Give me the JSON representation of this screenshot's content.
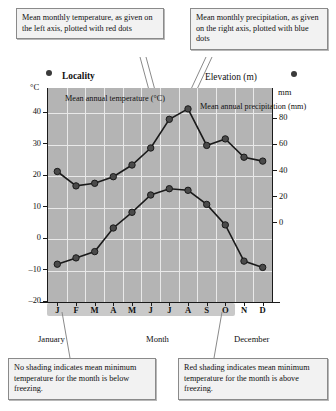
{
  "callouts": {
    "temperature": "Mean monthly temperature, as given on the left axis, plotted with red dots",
    "precipitation": "Mean monthly precipitation, as given on the right axis, plotted with blue dots",
    "no_shading": "No shading indicates mean minimum temperature for the month is below freezing.",
    "red_shading": "Red shading indicates mean minimum temperature for the month is above freezing."
  },
  "header": {
    "locality": "Locality",
    "elevation": "Elevation (m)",
    "left_unit": "°C",
    "right_unit": "mm"
  },
  "inline_labels": {
    "temperature": "Mean annual temperature (°C)",
    "precipitation": "Mean annual precipitation (mm)"
  },
  "footer": {
    "january": "January",
    "month": "Month",
    "december": "December"
  },
  "colors": {
    "plot_background": "#b4b4b4",
    "grid": "#e9e9e9",
    "series_marker": "#4a4a4a",
    "series_line": "#1a1a1a",
    "shade_band": "#c9c9c9",
    "callout_background": "#f2f2f2",
    "callout_border": "#8a8a8a"
  },
  "chart_data": {
    "type": "line",
    "title": "Locality",
    "xlabel": "Month",
    "categories": [
      "J",
      "F",
      "M",
      "A",
      "M",
      "J",
      "J",
      "A",
      "S",
      "O",
      "N",
      "D"
    ],
    "month_names": [
      "January",
      "February",
      "March",
      "April",
      "May",
      "June",
      "July",
      "August",
      "September",
      "October",
      "November",
      "December"
    ],
    "grid": true,
    "legend": "none",
    "shaded_months": [
      "M",
      "J",
      "J",
      "A",
      "S",
      "O"
    ],
    "shaded_note": "Red shading indicates mean minimum temperature for the month is above freezing.",
    "axes": {
      "left": {
        "label": "°C",
        "ticks": [
          -20,
          -10,
          0,
          10,
          20,
          30,
          40
        ],
        "tick_labels": [
          "-20",
          "-10",
          "0",
          "10",
          "20",
          "30",
          "40"
        ],
        "ylim": [
          -20,
          48
        ]
      },
      "right": {
        "label": "mm",
        "ticks": [
          0,
          20,
          40,
          60,
          80
        ],
        "tick_labels": [
          "0",
          "20",
          "40",
          "60",
          "80"
        ],
        "ylim": [
          -60,
          104
        ]
      }
    },
    "series": [
      {
        "name": "Mean annual temperature (°C)",
        "axis": "left",
        "unit": "°C",
        "marker": "red dots",
        "values": [
          -8,
          -6,
          -4,
          3.5,
          8.5,
          14,
          16,
          15.5,
          11,
          4.5,
          -7,
          -9
        ]
      },
      {
        "name": "Mean annual precipitation (mm)",
        "axis": "right",
        "unit": "mm",
        "marker": "blue dots",
        "values": [
          40,
          29,
          31,
          36,
          45,
          58,
          80,
          88,
          60,
          65,
          51,
          48
        ]
      }
    ]
  }
}
